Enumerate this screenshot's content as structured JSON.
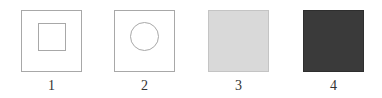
{
  "figure": {
    "panels": [
      {
        "label": "1",
        "shape": "square-inside-square",
        "fill": "#ffffff",
        "border": "#a8a8a8"
      },
      {
        "label": "2",
        "shape": "circle-inside-square",
        "fill": "#ffffff",
        "border": "#a8a8a8"
      },
      {
        "label": "3",
        "shape": "filled-square",
        "fill": "#d9d9d9",
        "border": "#c4c4c4"
      },
      {
        "label": "4",
        "shape": "filled-square",
        "fill": "#3a3a3a",
        "border": "#2e2e2e"
      }
    ]
  }
}
